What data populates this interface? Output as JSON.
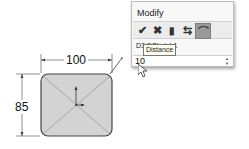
{
  "sketch": {
    "horizontal_dimension": "100",
    "vertical_dimension": "85",
    "fill_color": "#d3d3d3",
    "outline_color": "#444444"
  },
  "modify_dialog": {
    "title": "Modify",
    "toolbar": [
      {
        "name": "ok",
        "icon": "checkmark-icon",
        "glyph": "✔"
      },
      {
        "name": "cancel",
        "icon": "close-icon",
        "glyph": "✖"
      },
      {
        "name": "regenerate",
        "icon": "traffic-light-icon",
        "glyph": "▮"
      },
      {
        "name": "reverse-direction",
        "icon": "reverse-arrows-icon",
        "glyph": "⇆"
      },
      {
        "name": "mark-for-drawing",
        "icon": "mark-icon",
        "glyph": "⌒"
      }
    ],
    "dimension_name": "D3@Sketch1",
    "value": "10",
    "tooltip": "Distance"
  }
}
